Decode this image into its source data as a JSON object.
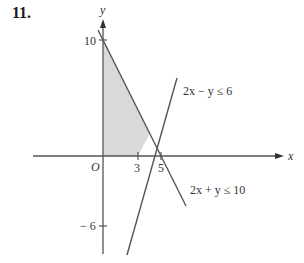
{
  "problem": {
    "number": "11."
  },
  "axes": {
    "x_label": "x",
    "y_label": "y",
    "origin_label": "O",
    "ticks": {
      "x": [
        {
          "value": 3,
          "label": "3"
        },
        {
          "value": 5,
          "label": "5"
        }
      ],
      "y": [
        {
          "value": 10,
          "label": "10"
        },
        {
          "value": -6,
          "label": "− 6"
        }
      ]
    }
  },
  "inequalities": [
    {
      "id": "line1",
      "label": "2x − y ≤ 6",
      "boundary": "2x - y = 6"
    },
    {
      "id": "line2",
      "label": "2x + y ≤ 10",
      "boundary": "2x + y = 10"
    }
  ],
  "feasible_region": {
    "vertices": [
      [
        0,
        0
      ],
      [
        3,
        0
      ],
      [
        4,
        2
      ],
      [
        0,
        10
      ]
    ],
    "fill_color": "#d9d9d9"
  },
  "colors": {
    "line": "#555555",
    "axis": "#555555",
    "text": "#333333"
  }
}
